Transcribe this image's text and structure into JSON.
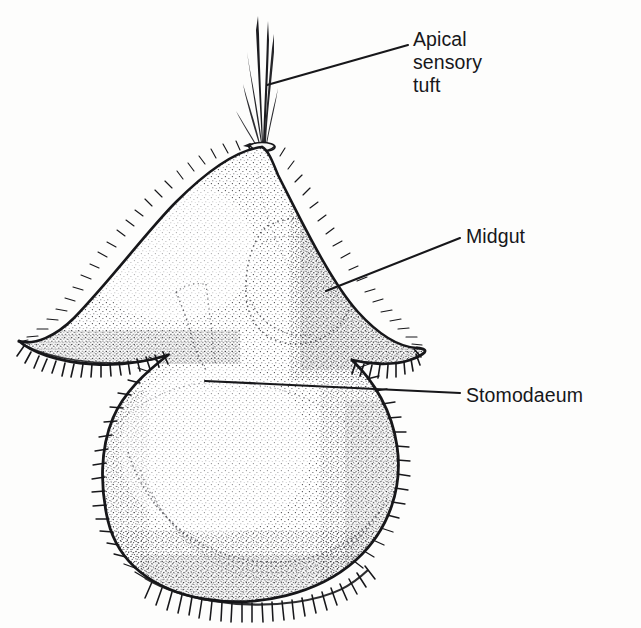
{
  "figure": {
    "title": "",
    "background_color": "#fdfdfc",
    "ink_color": "#17171a",
    "view": "lateral"
  },
  "labels": [
    {
      "id": "apical-sensory-tuft",
      "text": "Apical\nsensory\ntuft",
      "lines": [
        "Apical",
        "sensory",
        "tuft"
      ],
      "leader": {
        "from_x": 408,
        "from_y": 45,
        "to_x": 267,
        "to_y": 85
      }
    },
    {
      "id": "midgut",
      "text": "Midgut",
      "lines": [
        "Midgut"
      ],
      "leader": {
        "from_x": 460,
        "from_y": 238,
        "to_x": 326,
        "to_y": 291
      }
    },
    {
      "id": "stomodaeum",
      "text": "Stomodaeum",
      "lines": [
        "Stomodaeum"
      ],
      "leader": {
        "from_x": 460,
        "from_y": 393,
        "to_x": 205,
        "to_y": 381
      }
    }
  ],
  "anatomy": {
    "apical_tuft": {
      "name": "apical sensory tuft",
      "insertion_x": 262,
      "insertion_y": 143,
      "bristle_count": 7,
      "tip_y": 14
    },
    "body": {
      "name": "larval body",
      "apex_x": 262,
      "apex_y": 146,
      "left_lobe_tip_x": 18,
      "left_lobe_tip_y": 341,
      "right_lobe_tip_x": 417,
      "right_lobe_tip_y": 347,
      "bottom_y": 600,
      "lower_left_x": 104,
      "lower_right_x": 397
    },
    "midgut_sac": {
      "name": "midgut",
      "center_x": 300,
      "center_y": 290
    },
    "stomodaeum_outline": {
      "name": "stomodaeum",
      "center_x": 210,
      "center_y": 330
    },
    "ciliary_bands": [
      {
        "name": "prototroch",
        "position": "flange-underside"
      },
      {
        "name": "telotroch",
        "position": "posterior-margin"
      }
    ]
  }
}
